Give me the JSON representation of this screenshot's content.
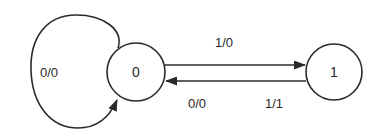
{
  "diagram": {
    "type": "finite-state-machine",
    "colors": {
      "stroke": "#2a2a2a",
      "background": "#ffffff",
      "text": "#2a2a2a"
    },
    "states": [
      {
        "id": "s0",
        "label": "0"
      },
      {
        "id": "s1",
        "label": "1"
      }
    ],
    "transitions": [
      {
        "from": "0",
        "to": "0",
        "label": "0/0"
      },
      {
        "from": "0",
        "to": "1",
        "label": "1/0"
      },
      {
        "from": "1",
        "to": "0",
        "label_input_output_0": "0/0",
        "label_input_output_1": "1/1"
      }
    ]
  }
}
